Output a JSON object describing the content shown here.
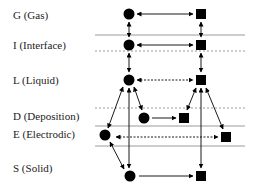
{
  "diagram": {
    "phases": [
      {
        "id": "G",
        "label": "G (Gas)",
        "y": 15
      },
      {
        "id": "I",
        "label": "I (Interface)",
        "y": 45
      },
      {
        "id": "L",
        "label": "L (Liquid)",
        "y": 80
      },
      {
        "id": "D",
        "label": "D (Deposition)",
        "y": 116
      },
      {
        "id": "E",
        "label": "E (Electrodic)",
        "y": 134
      },
      {
        "id": "S",
        "label": "S (Solid)",
        "y": 168
      }
    ],
    "boundaries": [
      {
        "y": 35,
        "style": "solid"
      },
      {
        "y": 51,
        "style": "dotted"
      },
      {
        "y": 108,
        "style": "dotted"
      },
      {
        "y": 126,
        "style": "solid"
      },
      {
        "y": 146,
        "style": "solid"
      }
    ],
    "circles": [
      {
        "phase": "G",
        "x": 129,
        "y": 14
      },
      {
        "phase": "I",
        "x": 129,
        "y": 45
      },
      {
        "phase": "L",
        "x": 129,
        "y": 80
      },
      {
        "phase": "D",
        "x": 144,
        "y": 118
      },
      {
        "phase": "E",
        "x": 105,
        "y": 135
      },
      {
        "phase": "S",
        "x": 130,
        "y": 176
      }
    ],
    "squares": [
      {
        "phase": "G",
        "x": 201,
        "y": 14
      },
      {
        "phase": "I",
        "x": 201,
        "y": 45
      },
      {
        "phase": "L",
        "x": 201,
        "y": 80
      },
      {
        "phase": "D",
        "x": 184,
        "y": 118
      },
      {
        "phase": "E",
        "x": 226,
        "y": 137
      },
      {
        "phase": "S",
        "x": 201,
        "y": 176
      }
    ],
    "colors": {
      "line": "#9a9a9a",
      "shape": "#000000",
      "text": "#222222"
    }
  }
}
